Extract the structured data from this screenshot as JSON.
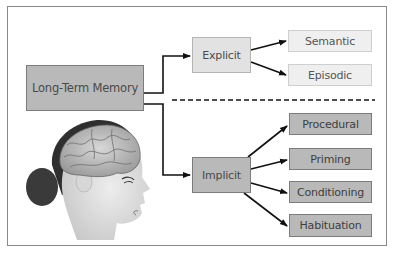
{
  "diagram": {
    "root": {
      "label": "Long-Term Memory"
    },
    "branches": [
      {
        "label": "Explicit",
        "children": [
          {
            "label": "Semantic"
          },
          {
            "label": "Episodic"
          }
        ]
      },
      {
        "label": "Implicit",
        "children": [
          {
            "label": "Procedural"
          },
          {
            "label": "Priming"
          },
          {
            "label": "Conditioning"
          },
          {
            "label": "Habituation"
          }
        ]
      }
    ],
    "illustration": "head-with-brain-profile"
  },
  "colors": {
    "root_fill": "#b9b9b9",
    "explicit_fill": "#e2e2e2",
    "explicit_children_fill": "#efefef",
    "implicit_fill": "#b9b9b9",
    "implicit_children_fill": "#b9b9b9",
    "line": "#111111"
  }
}
